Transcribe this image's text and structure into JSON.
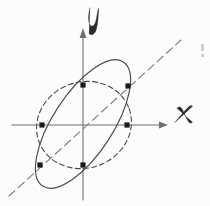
{
  "figure": {
    "title": "Hand-drawn coordinate diagram with two ellipses and a diagonal line",
    "background_color": "#fcfcfc",
    "ink_color": "#4a4a4a",
    "marker_color": "#1a1a1a",
    "width": 210,
    "height": 206
  },
  "axes": {
    "origin": {
      "x": 83,
      "y": 125
    },
    "x_axis": {
      "label": "x",
      "label_position": {
        "x": 181,
        "y": 116
      },
      "start": {
        "x": 12,
        "y": 125
      },
      "end": {
        "x": 168,
        "y": 125
      },
      "arrow_at": "end"
    },
    "y_axis": {
      "label": "y",
      "label_position": {
        "x": 93,
        "y": 22
      },
      "start": {
        "x": 83,
        "y": 200
      },
      "end": {
        "x": 83,
        "y": 30
      },
      "arrow_at": "end"
    }
  },
  "shapes": {
    "solid_ellipse": {
      "style": "solid",
      "center": {
        "x": 83,
        "y": 124
      },
      "semi_major": 74,
      "semi_minor": 30,
      "rotation_deg": -57
    },
    "dashed_ellipse": {
      "style": "dashed",
      "center": {
        "x": 84,
        "y": 125
      },
      "semi_major": 48,
      "semi_minor": 43,
      "rotation_deg": -20
    },
    "dashed_line": {
      "style": "dashed",
      "from": {
        "x": 9,
        "y": 196
      },
      "to": {
        "x": 181,
        "y": 40
      },
      "through_origin": true,
      "slope": 0.9
    }
  },
  "intersection_points": [
    {
      "label": "top-on-y-axis",
      "x": 83,
      "y": 85
    },
    {
      "label": "upper-right",
      "x": 128,
      "y": 86
    },
    {
      "label": "left-on-x-axis",
      "x": 42,
      "y": 125
    },
    {
      "label": "right-on-x-axis",
      "x": 127,
      "y": 125
    },
    {
      "label": "lower-left",
      "x": 40,
      "y": 165
    },
    {
      "label": "bottom-on-y-axis",
      "x": 83,
      "y": 165
    }
  ],
  "artifacts": [
    {
      "label": "scan-edge-mark",
      "x": 202,
      "y": 48,
      "width": 3,
      "height": 11
    }
  ]
}
